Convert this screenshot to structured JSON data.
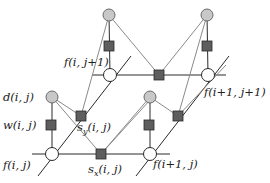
{
  "diagram": {
    "type": "factor-graph",
    "labels": {
      "d_ij": "d(i, j)",
      "w_ij": "w(i, j)",
      "f_ij": "f(i, j)",
      "sy_ij_base": "s",
      "sy_ij_sub": "y",
      "sy_ij_args": "(i, j)",
      "sx_ij_base": "s",
      "sx_ij_sub": "x",
      "sx_ij_args": "(i, j)",
      "f_i1j": "f(i+1, j)",
      "f_ij1": "f(i, j+1)",
      "f_i1j1": "f(i+1, j+1)"
    },
    "node_types": {
      "data_node": "gray circle",
      "variable_node": "white circle",
      "factor_node": "dark square"
    },
    "colors": {
      "data_fill": "#c8c8c8",
      "variable_fill": "#ffffff",
      "factor_fill": "#5e5e5e",
      "edge_dark": "#2a2a2a",
      "edge_light": "#8a8a8a"
    }
  }
}
